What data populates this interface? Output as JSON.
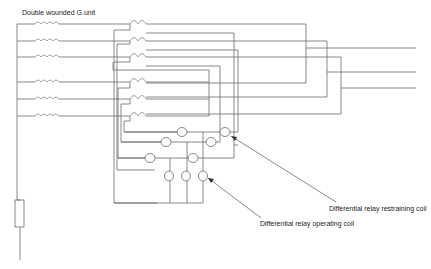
{
  "diagram": {
    "title": "Double wounded G.unit",
    "labels": {
      "restraining": "Differential relay restraining coil",
      "operating": "Differential relay operating coil"
    },
    "components": {
      "generator_windings": 6,
      "current_transformers": 6,
      "restraining_coils": 6,
      "operating_coils": 3,
      "neutral_resistor": 1,
      "output_lines": 3
    },
    "colors": {
      "wire": "#6a6a6a",
      "background": "#ffffff",
      "text": "#222222"
    }
  }
}
